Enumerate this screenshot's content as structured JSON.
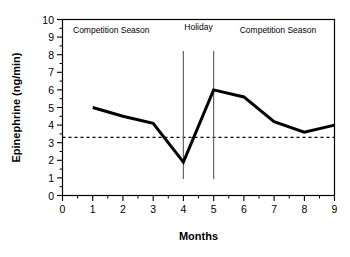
{
  "chart_data": {
    "type": "line",
    "title": "",
    "xlabel": "Months",
    "ylabel": "Epinephrine (ng/min)",
    "xlim": [
      0,
      9
    ],
    "ylim": [
      0,
      10
    ],
    "grid": false,
    "legend": "none",
    "x_ticks": [
      "0",
      "1",
      "2",
      "3",
      "4",
      "5",
      "6",
      "7",
      "8",
      "9"
    ],
    "y_ticks": [
      "0",
      "1",
      "2",
      "3",
      "4",
      "5",
      "6",
      "7",
      "8",
      "9",
      "10"
    ],
    "x_minor_ticks": [
      0.5,
      1.5,
      2.5,
      3.5,
      4.5,
      5.5,
      6.5,
      7.5,
      8.5
    ],
    "y_minor_ticks": [
      0.5,
      1.5,
      2.5,
      3.5,
      4.5,
      5.5,
      6.5,
      7.5,
      8.5,
      9.5
    ],
    "x": [
      1,
      2,
      3,
      4,
      5,
      6,
      7,
      8,
      9
    ],
    "values": [
      5.0,
      4.5,
      4.1,
      1.9,
      6.0,
      5.6,
      4.2,
      3.6,
      4.0
    ],
    "series": [
      {
        "name": "Epinephrine",
        "x": [
          1,
          2,
          3,
          4,
          5,
          6,
          7,
          8,
          9
        ],
        "values": [
          5.0,
          4.5,
          4.1,
          1.9,
          6.0,
          5.6,
          4.2,
          3.6,
          4.0
        ],
        "color": "#000000",
        "line_width": 3,
        "markers": false
      }
    ],
    "reference_line": {
      "name": "baseline",
      "orientation": "horizontal",
      "value": 3.3,
      "style": "dashed",
      "color": "#000000"
    },
    "period_dividers": [
      {
        "name": "holiday-start",
        "value": 4,
        "style": "solid",
        "color": "#666666"
      },
      {
        "name": "holiday-end",
        "value": 5,
        "style": "solid",
        "color": "#666666"
      }
    ],
    "annotations": [
      {
        "name": "competition-season-1",
        "text": "Competition Season",
        "x": 0.35,
        "y": 9.35,
        "anchor": "start"
      },
      {
        "name": "holiday",
        "text": "Holiday",
        "x": 4.5,
        "y": 9.55,
        "anchor": "middle"
      },
      {
        "name": "competition-season-2",
        "text": "Competition Season",
        "x": 7.15,
        "y": 9.35,
        "anchor": "middle"
      }
    ]
  }
}
